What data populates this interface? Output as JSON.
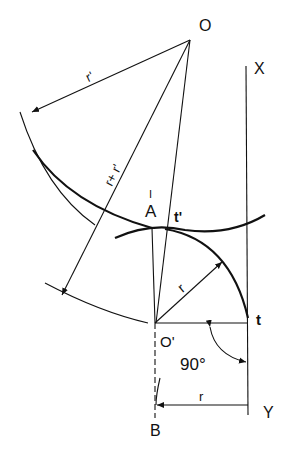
{
  "diagram": {
    "points": {
      "O": "O",
      "O_prime": "O'",
      "A": "A",
      "A_tick": "I",
      "t": "t",
      "t_prime": "t'",
      "X": "X",
      "Y": "Y",
      "B": "B"
    },
    "dimensions": {
      "r_prime": "r'",
      "r_plus_r_prime": "r+ r'",
      "r_radius": "r",
      "r_bottom": "r",
      "angle": "90°"
    }
  }
}
